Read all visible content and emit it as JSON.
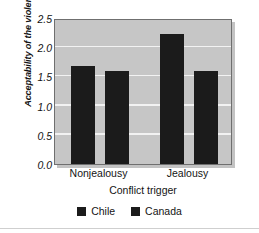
{
  "chart_data": {
    "type": "bar",
    "title": "",
    "subtitle": "",
    "xlabel": "Conflict trigger",
    "ylabel": "Acceptability of the violence",
    "categories": [
      "Nonjealousy",
      "Jealousy"
    ],
    "series": [
      {
        "name": "Chile",
        "values": [
          1.67,
          2.22
        ],
        "color": "#1b1b1b"
      },
      {
        "name": "Canada",
        "values": [
          1.6,
          1.6
        ],
        "color": "#1b1b1b"
      }
    ],
    "ylim": [
      0.0,
      2.5
    ],
    "ytick_labels": [
      "0.0",
      "0.5",
      "1.0",
      "1.5",
      "2.0",
      "2.5"
    ],
    "ytick_values": [
      0.0,
      0.5,
      1.0,
      1.5,
      2.0,
      2.5
    ],
    "grid": true,
    "grid_color": "#f2f2f2",
    "plot_background": "#c6c6c6",
    "figure_background": "#ffffff",
    "legend_position": "bottom",
    "legend_entries": [
      "Chile",
      "Canada"
    ]
  },
  "axis": {
    "y_title": "Acceptability of the violence",
    "x_title": "Conflict trigger"
  }
}
